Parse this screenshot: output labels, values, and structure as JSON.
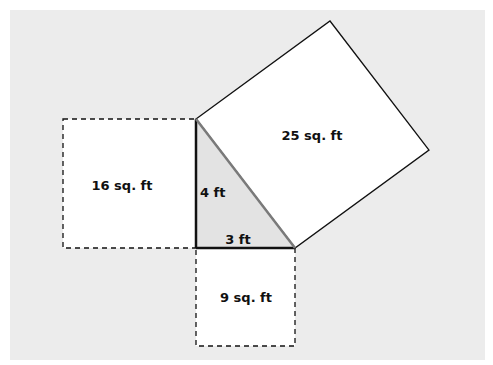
{
  "diagram": {
    "type": "pythagorean-theorem",
    "colors": {
      "background_panel": "#ececec",
      "square_fill": "#ffffff",
      "triangle_fill": "#e3e3e3",
      "stroke": "#111111",
      "hypotenuse": "#7a7a7a"
    },
    "triangle": {
      "vertical_leg_label": "4 ft",
      "horizontal_leg_label": "3 ft"
    },
    "squares": {
      "left": {
        "label": "16 sq. ft",
        "style": "dashed"
      },
      "bottom": {
        "label": "9 sq. ft",
        "style": "dashed"
      },
      "hypotenuse": {
        "label": "25 sq. ft",
        "style": "solid"
      }
    }
  }
}
